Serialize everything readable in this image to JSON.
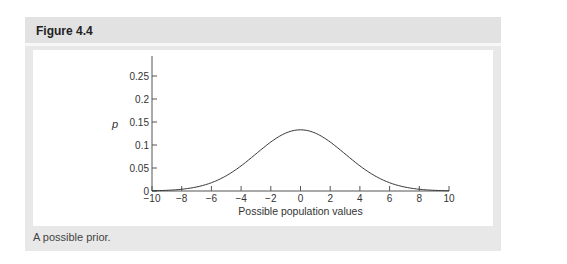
{
  "figure": {
    "title": "Figure 4.4",
    "caption": "A possible prior."
  },
  "chart_data": {
    "type": "line",
    "title": "",
    "xlabel": "Possible population values",
    "ylabel": "p",
    "xlim": [
      -10,
      10
    ],
    "ylim": [
      0,
      0.28
    ],
    "x_ticks": [
      -10,
      -8,
      -6,
      -4,
      -2,
      0,
      2,
      4,
      6,
      8,
      10
    ],
    "x_tick_labels": [
      "−10",
      "−8",
      "−6",
      "−4",
      "−2",
      "0",
      "2",
      "4",
      "6",
      "8",
      "10"
    ],
    "y_ticks": [
      0,
      0.05,
      0.1,
      0.15,
      0.2,
      0.25
    ],
    "y_tick_labels": [
      "0",
      "0.05",
      "0.1",
      "0.15",
      "0.2",
      "0.25"
    ],
    "grid": false,
    "legend": null,
    "series": [
      {
        "name": "prior",
        "description": "Normal distribution, mean 0, SD ~3",
        "x": [
          -10,
          -9,
          -8,
          -7,
          -6,
          -5,
          -4,
          -3,
          -2,
          -1,
          0,
          1,
          2,
          3,
          4,
          5,
          6,
          7,
          8,
          9,
          10
        ],
        "y": [
          0.0005,
          0.0015,
          0.0038,
          0.0088,
          0.018,
          0.0332,
          0.0547,
          0.0807,
          0.1065,
          0.1258,
          0.133,
          0.1258,
          0.1065,
          0.0807,
          0.0547,
          0.0332,
          0.018,
          0.0088,
          0.0038,
          0.0015,
          0.0005
        ]
      }
    ]
  }
}
